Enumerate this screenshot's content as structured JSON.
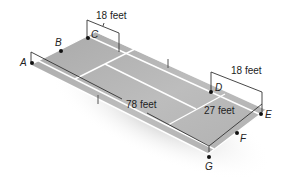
{
  "diagram": {
    "type": "tennis court perspective diagram",
    "colors": {
      "court": "#b8b8b8",
      "court_lines": "#ffffff",
      "dimension_lines": "#333333",
      "points": "#111111"
    },
    "points": [
      {
        "label": "A",
        "x": 32,
        "y": 63
      },
      {
        "label": "B",
        "x": 61,
        "y": 51
      },
      {
        "label": "C",
        "x": 88,
        "y": 38
      },
      {
        "label": "D",
        "x": 211,
        "y": 92
      },
      {
        "label": "E",
        "x": 261,
        "y": 114
      },
      {
        "label": "F",
        "x": 237,
        "y": 133
      },
      {
        "label": "G",
        "x": 209,
        "y": 157
      }
    ],
    "dimensions": {
      "top_width": "18 feet",
      "right_width": "18 feet",
      "length": "78 feet",
      "end_width": "27 feet"
    }
  }
}
